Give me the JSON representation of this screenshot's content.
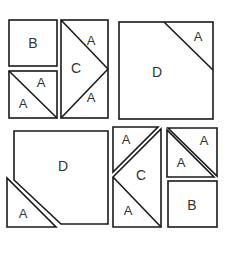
{
  "figure": {
    "canvas": {
      "width": 227,
      "height": 277
    },
    "colors": {
      "background": "#ffffff",
      "stroke": "#1a1a1a",
      "fill": "#ffffff",
      "label": "#333333"
    },
    "labels": {
      "a": "A",
      "b": "B",
      "c": "C",
      "d": "D"
    },
    "pieces": [
      {
        "id": "b-square-top-left",
        "label": "B",
        "shape": "square",
        "group": "top-left-column"
      },
      {
        "id": "a-rect-top-left-upper",
        "label": "A",
        "shape": "triangle",
        "group": "top-left-column"
      },
      {
        "id": "a-rect-top-left-lower",
        "label": "A",
        "shape": "triangle",
        "group": "top-left-column"
      },
      {
        "id": "a-tall-rect-top",
        "label": "A",
        "shape": "triangle",
        "group": "top-middle-column"
      },
      {
        "id": "c-tall-rect-middle",
        "label": "C",
        "shape": "triangle",
        "group": "top-middle-column"
      },
      {
        "id": "a-tall-rect-bottom",
        "label": "A",
        "shape": "triangle",
        "group": "top-middle-column"
      },
      {
        "id": "d-square-top-right",
        "label": "D",
        "shape": "pentagon",
        "group": "top-right"
      },
      {
        "id": "a-corner-top-right",
        "label": "A",
        "shape": "triangle",
        "group": "top-right"
      },
      {
        "id": "d-pentagon-bottom-left",
        "label": "D",
        "shape": "pentagon",
        "group": "bottom-left"
      },
      {
        "id": "a-triangle-bottom-left",
        "label": "A",
        "shape": "triangle",
        "group": "bottom-left"
      },
      {
        "id": "a-triangle-bottom-middle-upper",
        "label": "A",
        "shape": "triangle",
        "group": "bottom-middle"
      },
      {
        "id": "c-triangle-bottom-middle",
        "label": "C",
        "shape": "triangle",
        "group": "bottom-middle"
      },
      {
        "id": "a-triangle-bottom-middle-lower",
        "label": "A",
        "shape": "triangle",
        "group": "bottom-middle"
      },
      {
        "id": "a-triangle-bottom-right-upper",
        "label": "A",
        "shape": "triangle",
        "group": "bottom-right"
      },
      {
        "id": "a-triangle-bottom-right-lower",
        "label": "A",
        "shape": "triangle",
        "group": "bottom-right"
      },
      {
        "id": "b-square-bottom-right",
        "label": "B",
        "shape": "square",
        "group": "bottom-right"
      }
    ]
  }
}
